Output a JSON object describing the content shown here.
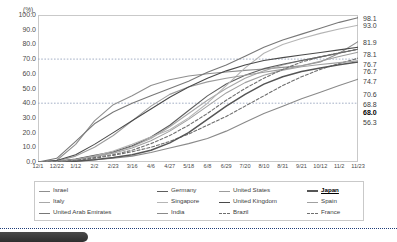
{
  "chart_data": {
    "type": "line",
    "title": "",
    "subtitle": "",
    "unit_label": "(%)",
    "xlabel": "",
    "ylabel": "",
    "ylim": [
      0,
      100
    ],
    "ytick_step": 10,
    "grid": "horizontal-dotted-at-40-and-70",
    "legend_position": "bottom",
    "reference_lines": [
      40.0,
      70.0
    ],
    "yticks": [
      "100.0",
      "90.0",
      "80.0",
      "70.0",
      "60.0",
      "50.0",
      "40.0",
      "30.0",
      "20.0",
      "10.0",
      "0.0"
    ],
    "x": [
      "12/1",
      "12/22",
      "1/12",
      "2/2",
      "2/23",
      "3/16",
      "4/6",
      "4/27",
      "5/18",
      "6/8",
      "6/29",
      "7/20",
      "8/10",
      "8/31",
      "9/21",
      "10/12",
      "11/2",
      "11/23"
    ],
    "series": [
      {
        "name": "Israel",
        "color": "#8f8f8f",
        "dash": "none",
        "end_value": 81.9,
        "values": [
          0.0,
          1.2,
          12.0,
          28.0,
          39.0,
          45.0,
          52.0,
          56.0,
          58.5,
          60.0,
          61.2,
          62.3,
          63.3,
          64.4,
          65.5,
          68.0,
          74.0,
          81.9
        ]
      },
      {
        "name": "Italy",
        "color": "#a8a8a8",
        "dash": "none",
        "end_value": 76.7,
        "values": [
          0.0,
          0.3,
          1.8,
          4.0,
          6.5,
          10.5,
          16.0,
          24.0,
          33.0,
          42.0,
          50.0,
          57.0,
          62.0,
          66.0,
          69.0,
          71.5,
          74.0,
          76.7
        ]
      },
      {
        "name": "United Arab Emirates",
        "color": "#787878",
        "dash": "none",
        "end_value": 98.1,
        "values": [
          0.0,
          2.5,
          14.0,
          26.0,
          34.0,
          40.0,
          45.0,
          50.0,
          55.0,
          61.0,
          66.0,
          72.0,
          78.0,
          83.0,
          87.0,
          91.0,
          95.0,
          98.1
        ]
      },
      {
        "name": "Germany",
        "color": "#5e5e5e",
        "dash": "none",
        "end_value": 76.7,
        "values": [
          0.0,
          0.4,
          2.0,
          4.5,
          7.0,
          11.0,
          17.0,
          25.0,
          35.0,
          45.0,
          53.0,
          59.0,
          63.5,
          66.5,
          69.0,
          71.5,
          74.2,
          76.7
        ]
      },
      {
        "name": "Singapore",
        "color": "#b5b5b5",
        "dash": "none",
        "end_value": 93.0,
        "values": [
          0.0,
          0.2,
          1.5,
          4.0,
          7.5,
          12.0,
          17.0,
          22.0,
          30.0,
          40.0,
          52.0,
          64.0,
          74.0,
          80.0,
          84.0,
          87.5,
          90.5,
          93.0
        ]
      },
      {
        "name": "India",
        "color": "#8a8a8a",
        "dash": "none",
        "end_value": 56.3,
        "values": [
          0.0,
          0.1,
          0.6,
          1.5,
          2.5,
          4.0,
          6.5,
          9.5,
          12.5,
          16.0,
          21.0,
          27.0,
          33.0,
          38.0,
          43.0,
          47.5,
          52.0,
          56.3
        ]
      },
      {
        "name": "United States",
        "color": "#9c9c9c",
        "dash": "none",
        "end_value": 74.7,
        "values": [
          0.0,
          0.5,
          4.0,
          10.0,
          18.0,
          28.0,
          38.0,
          46.0,
          51.0,
          54.5,
          57.0,
          59.0,
          61.0,
          63.0,
          65.5,
          68.5,
          71.8,
          74.7
        ]
      },
      {
        "name": "United Kingdom",
        "color": "#4a4a4a",
        "dash": "none",
        "end_value": 78.1,
        "values": [
          0.0,
          1.0,
          5.0,
          12.0,
          20.0,
          28.0,
          36.0,
          44.0,
          51.0,
          57.0,
          62.0,
          66.0,
          69.0,
          71.0,
          72.8,
          74.5,
          76.3,
          78.1
        ]
      },
      {
        "name": "Brazil",
        "color": "#6e6e6e",
        "dash": "dashed",
        "end_value": 70.6,
        "values": [
          0.0,
          0.2,
          1.0,
          2.5,
          4.5,
          7.0,
          10.0,
          14.0,
          19.0,
          25.0,
          31.0,
          38.0,
          45.0,
          52.0,
          58.0,
          63.0,
          67.0,
          70.6
        ]
      },
      {
        "name": "Japan",
        "color": "#555555",
        "dash": "none",
        "end_value": 68.0,
        "values": [
          0.0,
          0.1,
          0.5,
          1.5,
          3.0,
          5.0,
          8.0,
          13.0,
          20.0,
          29.0,
          38.0,
          46.0,
          53.0,
          58.0,
          61.5,
          64.0,
          66.2,
          68.0
        ]
      },
      {
        "name": "Spain",
        "color": "#a0a0a0",
        "dash": "none",
        "end_value": 68.8,
        "values": [
          0.0,
          0.3,
          1.6,
          3.8,
          6.0,
          9.5,
          14.5,
          21.0,
          29.0,
          38.0,
          47.0,
          54.0,
          59.0,
          62.5,
          64.8,
          66.3,
          67.6,
          68.8
        ]
      },
      {
        "name": "France",
        "color": "#707070",
        "dash": "dashed",
        "end_value": 76.7,
        "values": [
          0.0,
          0.2,
          1.2,
          3.0,
          5.0,
          8.0,
          12.5,
          18.0,
          25.0,
          33.0,
          42.0,
          50.0,
          57.0,
          63.0,
          68.0,
          71.5,
          74.3,
          76.7
        ]
      }
    ],
    "end_labels": [
      "98.1",
      "93.0",
      "81.9",
      "78.1",
      "76.7",
      "76.7",
      "74.7",
      "70.6",
      "68.8",
      "68.0",
      "56.3"
    ],
    "highlighted_series": "Japan"
  },
  "legend": {
    "items": [
      {
        "label": "Israel"
      },
      {
        "label": "Germany"
      },
      {
        "label": "United States"
      },
      {
        "label": "Japan"
      },
      {
        "label": "Italy"
      },
      {
        "label": "Singapore"
      },
      {
        "label": "United Kingdom"
      },
      {
        "label": "Spain"
      },
      {
        "label": "United Arab Emirates"
      },
      {
        "label": "India"
      },
      {
        "label": "Brazil"
      },
      {
        "label": "France"
      }
    ]
  }
}
